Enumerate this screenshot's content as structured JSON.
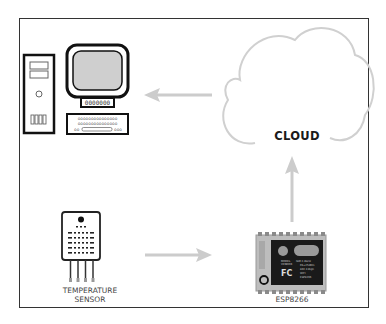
{
  "diagram": {
    "nodes": [
      {
        "id": "computer",
        "label": ""
      },
      {
        "id": "cloud",
        "label": "CLOUD"
      },
      {
        "id": "temperature_sensor",
        "label": "TEMPERATURE SENSOR"
      },
      {
        "id": "esp8266",
        "label": "ESP8266"
      }
    ],
    "edges": [
      {
        "from": "temperature_sensor",
        "to": "esp8266"
      },
      {
        "from": "esp8266",
        "to": "cloud"
      },
      {
        "from": "cloud",
        "to": "computer"
      }
    ],
    "labels": {
      "cloud": "CLOUD",
      "sensor_line1": "TEMPERATURE",
      "sensor_line2": "SENSOR",
      "esp": "ESP8266"
    },
    "colors": {
      "frame": "#333333",
      "arrow": "#cccccc",
      "cloud_outline": "#d0d0d0",
      "screen": "#cfcfcf",
      "chip_body": "#bdbdbd",
      "chip_shield": "#1a1a1a"
    }
  }
}
